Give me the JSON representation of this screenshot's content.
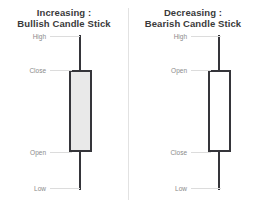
{
  "figure": {
    "background_color": "#ffffff",
    "divider_color": "#e2e2e2",
    "label_color": "#8a8a8a",
    "title_color": "#3a3a3a",
    "outline_color": "#35353a"
  },
  "chart_data": {
    "type": "diagram",
    "panels": [
      {
        "id": "bullish",
        "title_line1": "Increasing :",
        "title_line2": "Bullish Candle Stick",
        "body_fill": "#e9e9e9",
        "body_outline": "#35353a",
        "labels": [
          {
            "key": "high",
            "text": "High",
            "position": "top-of-upper-wick"
          },
          {
            "key": "close",
            "text": "Close",
            "position": "top-of-body"
          },
          {
            "key": "open",
            "text": "Open",
            "position": "bottom-of-body"
          },
          {
            "key": "low",
            "text": "Low",
            "position": "bottom-of-lower-wick"
          }
        ]
      },
      {
        "id": "bearish",
        "title_line1": "Decreasing :",
        "title_line2": "Bearish Candle Stick",
        "body_fill": "#ffffff",
        "body_outline": "#35353a",
        "labels": [
          {
            "key": "high",
            "text": "High",
            "position": "top-of-upper-wick"
          },
          {
            "key": "open",
            "text": "Open",
            "position": "top-of-body"
          },
          {
            "key": "close",
            "text": "Close",
            "position": "bottom-of-body"
          },
          {
            "key": "low",
            "text": "Low",
            "position": "bottom-of-lower-wick"
          }
        ]
      }
    ]
  }
}
